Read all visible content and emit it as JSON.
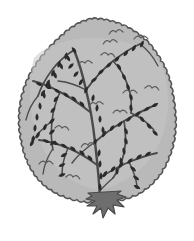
{
  "image": {
    "title": "Deciduous Tree Line Illustration",
    "subject": "tree",
    "style": "black-and-white stylized clip art, grayscale",
    "background_color": "#ffffff",
    "width": 194,
    "height": 241
  },
  "palette": {
    "background": "#ffffff",
    "canopy_fill": "#b9b9b9",
    "canopy_outline": "#555555",
    "canopy_inner_shade": "#c6c6c6",
    "branch_stroke": "#4a4a4a",
    "leaf_fill": "#2b2b2b",
    "bird_mark": "#5a5a5a",
    "trunk_fill": "#6e6e6e",
    "trunk_outline": "#4a4a4a"
  },
  "parts": [
    {
      "id": "canopy",
      "label": "Tree canopy",
      "description": "Large rounded crown with scalloped wavy outline",
      "fill": "#b9b9b9",
      "outline": "#555555"
    },
    {
      "id": "branches",
      "label": "Branches",
      "description": "Dark curving branch lines spreading through the canopy",
      "stroke": "#4a4a4a"
    },
    {
      "id": "leaves",
      "label": "Leaves",
      "description": "Small dark teardrop shapes along the branches",
      "fill": "#2b2b2b",
      "count": 86
    },
    {
      "id": "birds",
      "label": "Bird marks",
      "description": "Small V shaped squiggles suggesting distant birds",
      "stroke": "#5a5a5a",
      "count": 11
    },
    {
      "id": "trunk",
      "label": "Trunk",
      "description": "Short dark star shaped trunk with flared roots at the base",
      "fill": "#6e6e6e"
    }
  ],
  "geometry": {
    "canopy_bounds": {
      "x": 18,
      "y": 18,
      "width": 160,
      "height": 184
    },
    "trunk_bounds": {
      "x": 82,
      "y": 193,
      "width": 44,
      "height": 26
    }
  },
  "canopy": {
    "label": "Tree canopy",
    "scallop_radius": 4.6,
    "path_points": [
      [
        92,
        19
      ],
      [
        104,
        20
      ],
      [
        116,
        23
      ],
      [
        128,
        28
      ],
      [
        139,
        35
      ],
      [
        149,
        44
      ],
      [
        157,
        55
      ],
      [
        164,
        67
      ],
      [
        169,
        80
      ],
      [
        172,
        94
      ],
      [
        174,
        108
      ],
      [
        175,
        122
      ],
      [
        174,
        136
      ],
      [
        171,
        150
      ],
      [
        166,
        163
      ],
      [
        159,
        175
      ],
      [
        150,
        185
      ],
      [
        139,
        193
      ],
      [
        126,
        198
      ],
      [
        112,
        201
      ],
      [
        98,
        202
      ],
      [
        84,
        201
      ],
      [
        70,
        198
      ],
      [
        57,
        193
      ],
      [
        46,
        186
      ],
      [
        37,
        177
      ],
      [
        30,
        166
      ],
      [
        25,
        154
      ],
      [
        22,
        141
      ],
      [
        20,
        127
      ],
      [
        20,
        113
      ],
      [
        22,
        99
      ],
      [
        26,
        85
      ],
      [
        32,
        72
      ],
      [
        40,
        60
      ],
      [
        49,
        49
      ],
      [
        59,
        39
      ],
      [
        69,
        30
      ],
      [
        80,
        23
      ]
    ]
  },
  "branches": {
    "label": "Branches",
    "strokes": [
      {
        "d": "M 100 197 C 99 180 97 160 95 142 C 93 124 90 106 86 90 C 83 76 79 62 74 50",
        "width": 2.4
      },
      {
        "d": "M 95 142 C 104 134 114 127 124 121 C 134 115 144 110 153 106",
        "width": 2.0
      },
      {
        "d": "M 90 112 C 80 104 70 97 60 92 C 51 87 42 83 33 81",
        "width": 2.0
      },
      {
        "d": "M 86 90 C 94 79 103 69 113 61 C 122 54 131 48 140 44",
        "width": 1.9
      },
      {
        "d": "M 97 165 C 88 158 78 152 68 148 C 58 144 48 141 39 140",
        "width": 1.9
      },
      {
        "d": "M 99 178 C 109 172 119 166 129 162 C 139 158 148 155 157 153",
        "width": 1.8
      },
      {
        "d": "M 74 50 C 66 55 58 62 52 70 C 46 78 41 87 38 96",
        "width": 1.7
      },
      {
        "d": "M 124 121 C 126 132 126 143 124 153 C 122 162 118 171 113 178",
        "width": 1.7
      },
      {
        "d": "M 60 92 C 56 101 53 111 52 121 C 51 131 51 141 53 150",
        "width": 1.6
      },
      {
        "d": "M 113 61 C 120 68 125 77 128 86 C 131 95 132 104 131 113",
        "width": 1.6
      },
      {
        "d": "M 68 148 C 64 157 62 166 62 175",
        "width": 1.5
      },
      {
        "d": "M 129 162 C 133 170 136 178 137 186",
        "width": 1.5
      },
      {
        "d": "M 52 121 C 44 127 37 134 32 142",
        "width": 1.4
      },
      {
        "d": "M 131 113 C 140 117 148 123 154 130",
        "width": 1.4
      },
      {
        "d": "M 38 96 C 32 103 28 111 26 120",
        "width": 1.3
      },
      {
        "d": "M 140 44 C 148 50 154 58 158 66",
        "width": 1.3
      },
      {
        "d": "M 95 142 C 86 148 78 155 72 163",
        "width": 1.5
      },
      {
        "d": "M 86 90 C 77 85 68 82 58 81",
        "width": 1.4
      },
      {
        "d": "M 113 178 C 106 184 100 190 96 196",
        "width": 1.3
      },
      {
        "d": "M 52 150 C 47 158 44 166 43 174",
        "width": 1.3
      }
    ]
  },
  "leaves": {
    "label": "Leaves",
    "positions": [
      [
        74,
        50,
        -35
      ],
      [
        68,
        58,
        -30
      ],
      [
        61,
        66,
        -25
      ],
      [
        55,
        75,
        -20
      ],
      [
        49,
        85,
        -15
      ],
      [
        44,
        95,
        -10
      ],
      [
        40,
        106,
        -5
      ],
      [
        37,
        117,
        0
      ],
      [
        35,
        128,
        5
      ],
      [
        33,
        139,
        10
      ],
      [
        86,
        90,
        20
      ],
      [
        81,
        82,
        30
      ],
      [
        76,
        74,
        40
      ],
      [
        71,
        66,
        45
      ],
      [
        93,
        98,
        10
      ],
      [
        97,
        108,
        5
      ],
      [
        100,
        119,
        0
      ],
      [
        103,
        130,
        -5
      ],
      [
        95,
        142,
        15
      ],
      [
        99,
        153,
        10
      ],
      [
        100,
        164,
        5
      ],
      [
        101,
        176,
        0
      ],
      [
        100,
        187,
        -5
      ],
      [
        104,
        134,
        30
      ],
      [
        112,
        128,
        35
      ],
      [
        120,
        124,
        40
      ],
      [
        129,
        119,
        45
      ],
      [
        138,
        114,
        50
      ],
      [
        147,
        109,
        55
      ],
      [
        155,
        105,
        60
      ],
      [
        82,
        104,
        -40
      ],
      [
        74,
        99,
        -45
      ],
      [
        66,
        95,
        -50
      ],
      [
        57,
        91,
        -55
      ],
      [
        48,
        87,
        -60
      ],
      [
        39,
        84,
        -65
      ],
      [
        94,
        80,
        55
      ],
      [
        101,
        72,
        50
      ],
      [
        109,
        65,
        45
      ],
      [
        117,
        59,
        40
      ],
      [
        126,
        53,
        35
      ],
      [
        134,
        48,
        30
      ],
      [
        142,
        44,
        25
      ],
      [
        90,
        158,
        -40
      ],
      [
        82,
        153,
        -45
      ],
      [
        73,
        149,
        -50
      ],
      [
        64,
        146,
        -55
      ],
      [
        55,
        143,
        -60
      ],
      [
        46,
        141,
        -65
      ],
      [
        105,
        174,
        30
      ],
      [
        113,
        169,
        35
      ],
      [
        121,
        165,
        40
      ],
      [
        130,
        161,
        45
      ],
      [
        139,
        157,
        50
      ],
      [
        148,
        154,
        55
      ],
      [
        66,
        56,
        10
      ],
      [
        59,
        64,
        15
      ],
      [
        53,
        73,
        20
      ],
      [
        48,
        83,
        25
      ],
      [
        43,
        93,
        30
      ],
      [
        126,
        131,
        -20
      ],
      [
        126,
        141,
        -15
      ],
      [
        124,
        151,
        -10
      ],
      [
        121,
        161,
        -5
      ],
      [
        117,
        171,
        0
      ],
      [
        56,
        99,
        35
      ],
      [
        53,
        110,
        40
      ],
      [
        52,
        121,
        45
      ],
      [
        52,
        132,
        50
      ],
      [
        53,
        143,
        55
      ],
      [
        119,
        67,
        -30
      ],
      [
        124,
        77,
        -25
      ],
      [
        128,
        87,
        -20
      ],
      [
        131,
        97,
        -15
      ],
      [
        131,
        108,
        -10
      ],
      [
        64,
        155,
        60
      ],
      [
        62,
        165,
        65
      ],
      [
        62,
        175,
        70
      ],
      [
        133,
        169,
        -50
      ],
      [
        136,
        178,
        -55
      ],
      [
        137,
        187,
        -60
      ],
      [
        45,
        127,
        20
      ],
      [
        38,
        135,
        25
      ],
      [
        32,
        143,
        30
      ],
      [
        142,
        119,
        -35
      ],
      [
        149,
        126,
        -40
      ],
      [
        155,
        133,
        -45
      ]
    ],
    "shape": "teardrop",
    "length": 7.5,
    "width": 4.2
  },
  "birds": {
    "label": "Bird marks",
    "positions": [
      [
        116,
        32
      ],
      [
        141,
        38
      ],
      [
        108,
        55
      ],
      [
        85,
        63
      ],
      [
        130,
        92
      ],
      [
        152,
        88
      ],
      [
        96,
        104
      ],
      [
        120,
        112
      ],
      [
        62,
        128
      ],
      [
        88,
        145
      ],
      [
        46,
        163
      ],
      [
        73,
        177
      ],
      [
        110,
        42
      ]
    ],
    "size": 7
  },
  "trunk": {
    "label": "Trunk",
    "path": "M 88 193 L 92 196 L 86 199 L 95 201 L 87 206 L 97 206 L 93 214 L 101 208 L 103 218 L 108 208 L 115 214 L 113 205 L 124 207 L 117 200 L 126 197 L 117 194 L 121 191 Z",
    "fill": "#6e6e6e",
    "outline": "#4a4a4a"
  }
}
